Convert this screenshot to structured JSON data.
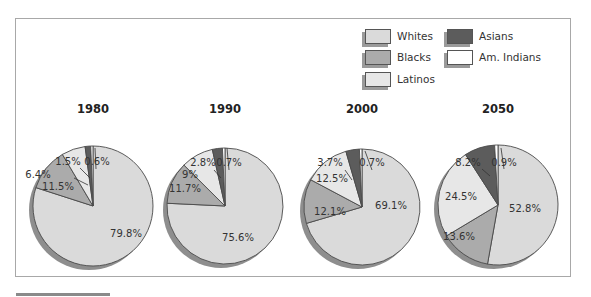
{
  "chart_data": {
    "type": "pie",
    "title": "",
    "legend": {
      "position": "top-right",
      "entries": [
        {
          "name": "Whites",
          "color": "#dadada"
        },
        {
          "name": "Blacks",
          "color": "#ababab"
        },
        {
          "name": "Latinos",
          "color": "#e7e7e7"
        },
        {
          "name": "Asians",
          "color": "#5c5c5c"
        },
        {
          "name": "Am. Indians",
          "color": "#ffffff"
        }
      ]
    },
    "categories": [
      "Whites",
      "Blacks",
      "Latinos",
      "Asians",
      "Am. Indians"
    ],
    "pies": [
      {
        "title": "1980",
        "values": [
          79.8,
          11.5,
          6.4,
          1.5,
          0.6
        ],
        "labels": [
          "79.8%",
          "11.5%",
          "6.4%",
          "1.5%",
          "0.6%"
        ]
      },
      {
        "title": "1990",
        "values": [
          75.6,
          11.7,
          9,
          2.8,
          0.7
        ],
        "labels": [
          "75.6%",
          "11.7%",
          "9%",
          "2.8%",
          "0.7%"
        ]
      },
      {
        "title": "2000",
        "values": [
          69.1,
          12.1,
          12.5,
          3.7,
          0.7
        ],
        "labels": [
          "69.1%",
          "12.1%",
          "12.5%",
          "3.7%",
          "0.7%"
        ]
      },
      {
        "title": "2050",
        "values": [
          52.8,
          13.6,
          24.5,
          8.2,
          0.9
        ],
        "labels": [
          "52.8%",
          "13.6%",
          "24.5%",
          "8.2%",
          "0.9%"
        ]
      }
    ]
  },
  "legend": {
    "whites": "Whites",
    "blacks": "Blacks",
    "latinos": "Latinos",
    "asians": "Asians",
    "am_indians": "Am. Indians"
  },
  "colors": {
    "whites": "#dadada",
    "blacks": "#ababab",
    "latinos": "#e7e7e7",
    "asians": "#5c5c5c",
    "am_indians": "#ffffff",
    "outline": "#4a4a4a",
    "shadow": "#8e8e8e"
  }
}
